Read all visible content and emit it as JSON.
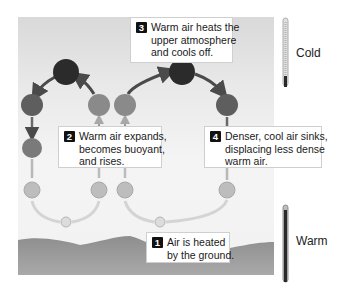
{
  "diagram": {
    "colors": {
      "panel_top": "#d9d9d9",
      "ground": "#9a9a9a",
      "circle_dark": "#2e2e2e",
      "circle_mid": "#6e6e6e",
      "circle_light": "#a0a0a0",
      "circle_pale": "#c8c8c8",
      "arrow": "#5a5a5a"
    },
    "steps": [
      {
        "number": "1",
        "lines": [
          "Air is heated",
          "by the ground."
        ]
      },
      {
        "number": "2",
        "lines": [
          "Warm air expands,",
          "becomes buoyant,",
          "and rises."
        ]
      },
      {
        "number": "3",
        "lines": [
          "Warm air heats the",
          "upper atmosphere",
          "and cools off."
        ]
      },
      {
        "number": "4",
        "lines": [
          "Denser, cool air sinks,",
          "displacing less dense",
          "warm air."
        ]
      }
    ],
    "thermometers": [
      {
        "label": "Cold",
        "position": "top"
      },
      {
        "label": "Warm",
        "position": "bottom"
      }
    ]
  }
}
